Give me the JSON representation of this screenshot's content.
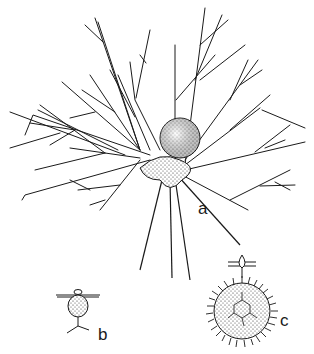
{
  "figure": {
    "colors": {
      "ink": "#1a1a1a",
      "background": "#ffffff",
      "stipple": "#2a2a2a"
    },
    "panels": [
      {
        "id": "a",
        "label": "a",
        "subject": "central spherical cell body with branching radiating filaments (large view)"
      },
      {
        "id": "b",
        "label": "b",
        "subject": "small stippled cell on horizontal bar with forked stalk below"
      },
      {
        "id": "c",
        "label": "c",
        "subject": "spiny spherical cell with polygonal inner pattern and teardrop appendage on bar above"
      }
    ]
  }
}
